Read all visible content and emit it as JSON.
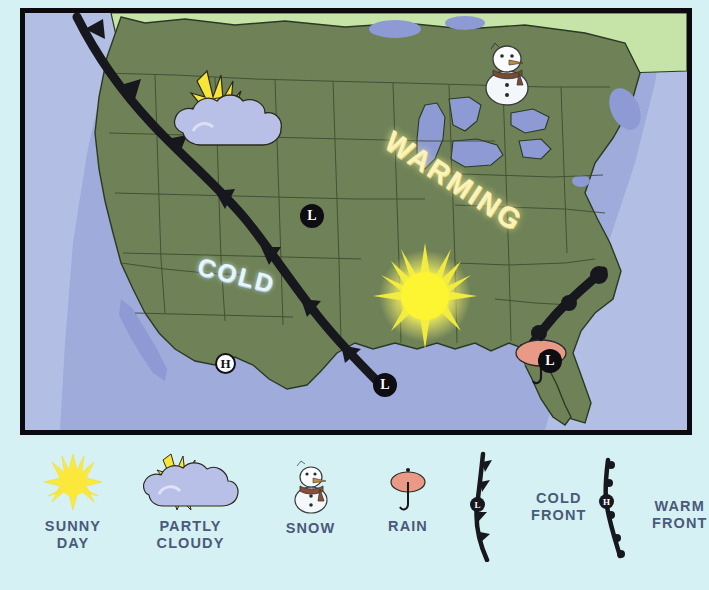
{
  "page": {
    "background_color": "#d6f1f4"
  },
  "map": {
    "frame_border_color": "#0a0a0f",
    "ocean_color": "#9fabda",
    "land_color": "#6f8257",
    "canada_color": "#c6e3a8",
    "lake_color": "#8d9ad4",
    "front_color": "#17171e",
    "overlay_labels": [
      {
        "id": "cold",
        "text": "COLD",
        "color": "#e8f6fb"
      },
      {
        "id": "warming",
        "text": "WARMING",
        "color": "#fbf3b8"
      }
    ],
    "pressure_markers": [
      {
        "id": "h-map",
        "text": "H",
        "kind": "high"
      },
      {
        "id": "l-north",
        "text": "L",
        "kind": "low"
      },
      {
        "id": "l-gulf",
        "text": "L",
        "kind": "low"
      },
      {
        "id": "l-southeast",
        "text": "L",
        "kind": "low"
      }
    ],
    "weather_icons": [
      {
        "id": "partly-cloudy-northwest",
        "name": "partly-cloudy-icon"
      },
      {
        "id": "snowman-great-lakes",
        "name": "snow-icon"
      },
      {
        "id": "sun-central",
        "name": "sunny-icon"
      },
      {
        "id": "rain-florida",
        "name": "rain-icon"
      }
    ]
  },
  "legend": {
    "items": [
      {
        "id": "sunny",
        "label_line1": "SUNNY",
        "label_line2": "DAY",
        "icon": "sunny-icon"
      },
      {
        "id": "partly",
        "label_line1": "PARTLY",
        "label_line2": "CLOUDY",
        "icon": "partly-cloudy-icon"
      },
      {
        "id": "snow",
        "label_line1": "SNOW",
        "label_line2": "",
        "icon": "snow-icon"
      },
      {
        "id": "rain",
        "label_line1": "RAIN",
        "label_line2": "",
        "icon": "rain-icon"
      },
      {
        "id": "cold-front",
        "label_line1": "COLD",
        "label_line2": "FRONT",
        "icon": "cold-front-icon",
        "marker": "L"
      },
      {
        "id": "warm-front",
        "label_line1": "WARM",
        "label_line2": "FRONT",
        "icon": "warm-front-icon",
        "marker": "H"
      }
    ],
    "text_color": "#4a5a7a"
  }
}
